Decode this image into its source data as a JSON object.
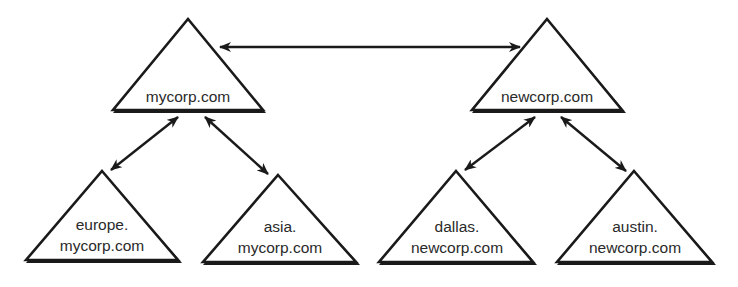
{
  "diagram": {
    "type": "domain-trust-trees",
    "colors": {
      "stroke": "#1a1a1a",
      "text": "#2a2a2a",
      "fill": "#ffffff"
    },
    "nodes": [
      {
        "id": "mycorp",
        "lines": [
          "mycorp.com"
        ]
      },
      {
        "id": "newcorp",
        "lines": [
          "newcorp.com"
        ]
      },
      {
        "id": "europe",
        "lines": [
          "europe.",
          "mycorp.com"
        ]
      },
      {
        "id": "asia",
        "lines": [
          "asia.",
          "mycorp.com"
        ]
      },
      {
        "id": "dallas",
        "lines": [
          "dallas.",
          "newcorp.com"
        ]
      },
      {
        "id": "austin",
        "lines": [
          "austin.",
          "newcorp.com"
        ]
      }
    ],
    "edges": [
      {
        "from": "mycorp",
        "to": "newcorp",
        "type": "bidirectional"
      },
      {
        "from": "mycorp",
        "to": "europe",
        "type": "bidirectional"
      },
      {
        "from": "mycorp",
        "to": "asia",
        "type": "bidirectional"
      },
      {
        "from": "newcorp",
        "to": "dallas",
        "type": "bidirectional"
      },
      {
        "from": "newcorp",
        "to": "austin",
        "type": "bidirectional"
      }
    ]
  }
}
